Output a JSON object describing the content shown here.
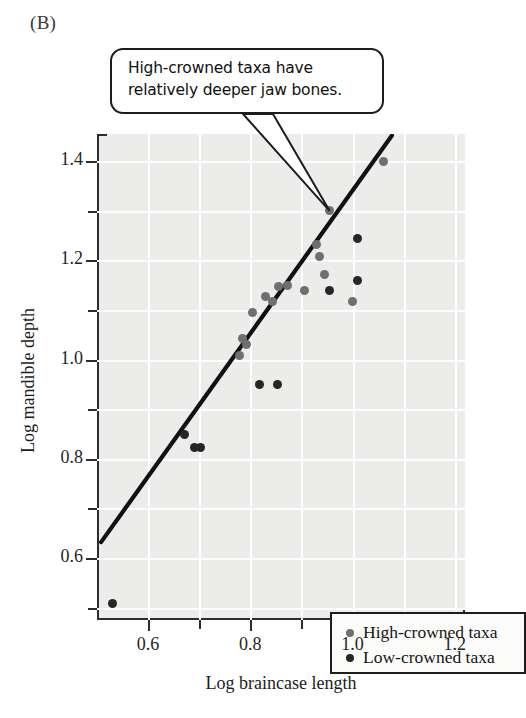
{
  "panel": {
    "label": "(B)"
  },
  "callout": {
    "line1": "High-crowned taxa have",
    "line2": "relatively deeper jaw bones.",
    "target_x": 0.955,
    "target_y": 1.3
  },
  "legend": {
    "items": [
      {
        "key": "high",
        "label": "High-crowned taxa",
        "color": "#6f6f6f"
      },
      {
        "key": "low",
        "label": "Low-crowned taxa",
        "color": "#262626"
      }
    ]
  },
  "axes": {
    "x": {
      "title": "Log braincase length",
      "min": 0.5,
      "max": 1.22,
      "major_ticks": [
        0.6,
        0.8,
        1.0,
        1.2
      ],
      "major_labels": [
        "0.6",
        "0.8",
        "1.0",
        "1.2"
      ],
      "minor_ticks": [
        0.7,
        0.9,
        1.1
      ]
    },
    "y": {
      "title": "Log mandible depth",
      "min": 0.475,
      "max": 1.455,
      "major_ticks": [
        0.6,
        0.8,
        1.0,
        1.2,
        1.4
      ],
      "major_labels": [
        "0.6",
        "0.8",
        "1.0",
        "1.2",
        "1.4"
      ],
      "minor_ticks": [
        0.5,
        0.7,
        0.9,
        1.1,
        1.3
      ]
    }
  },
  "chart_data": {
    "type": "scatter",
    "title": "",
    "xlabel": "Log braincase length",
    "ylabel": "Log mandible depth",
    "xlim": [
      0.5,
      1.22
    ],
    "ylim": [
      0.475,
      1.455
    ],
    "grid": true,
    "legend_position": "inside-bottom-right",
    "annotation": "High-crowned taxa have relatively deeper jaw bones.",
    "series": [
      {
        "name": "High-crowned taxa",
        "color": "#6f6f6f",
        "points": [
          [
            0.955,
            1.3
          ],
          [
            1.06,
            1.4
          ],
          [
            0.93,
            1.233
          ],
          [
            0.935,
            1.207
          ],
          [
            0.945,
            1.172
          ],
          [
            0.855,
            1.148
          ],
          [
            0.83,
            1.128
          ],
          [
            0.843,
            1.117
          ],
          [
            0.872,
            1.15
          ],
          [
            0.805,
            1.095
          ],
          [
            0.785,
            1.042
          ],
          [
            0.793,
            1.03
          ],
          [
            0.778,
            1.008
          ],
          [
            0.905,
            1.14
          ],
          [
            1.0,
            1.118
          ]
        ]
      },
      {
        "name": "Low-crowned taxa",
        "color": "#262626",
        "points": [
          [
            1.01,
            1.245
          ],
          [
            1.01,
            1.16
          ],
          [
            0.955,
            1.14
          ],
          [
            0.818,
            0.95
          ],
          [
            0.853,
            0.95
          ],
          [
            0.672,
            0.85
          ],
          [
            0.69,
            0.822
          ],
          [
            0.703,
            0.822
          ],
          [
            0.53,
            0.508
          ]
        ]
      }
    ],
    "trendline": {
      "type": "linear",
      "x_start": 0.508,
      "y_start": 0.632,
      "x_end": 1.077,
      "y_end": 1.452
    }
  }
}
